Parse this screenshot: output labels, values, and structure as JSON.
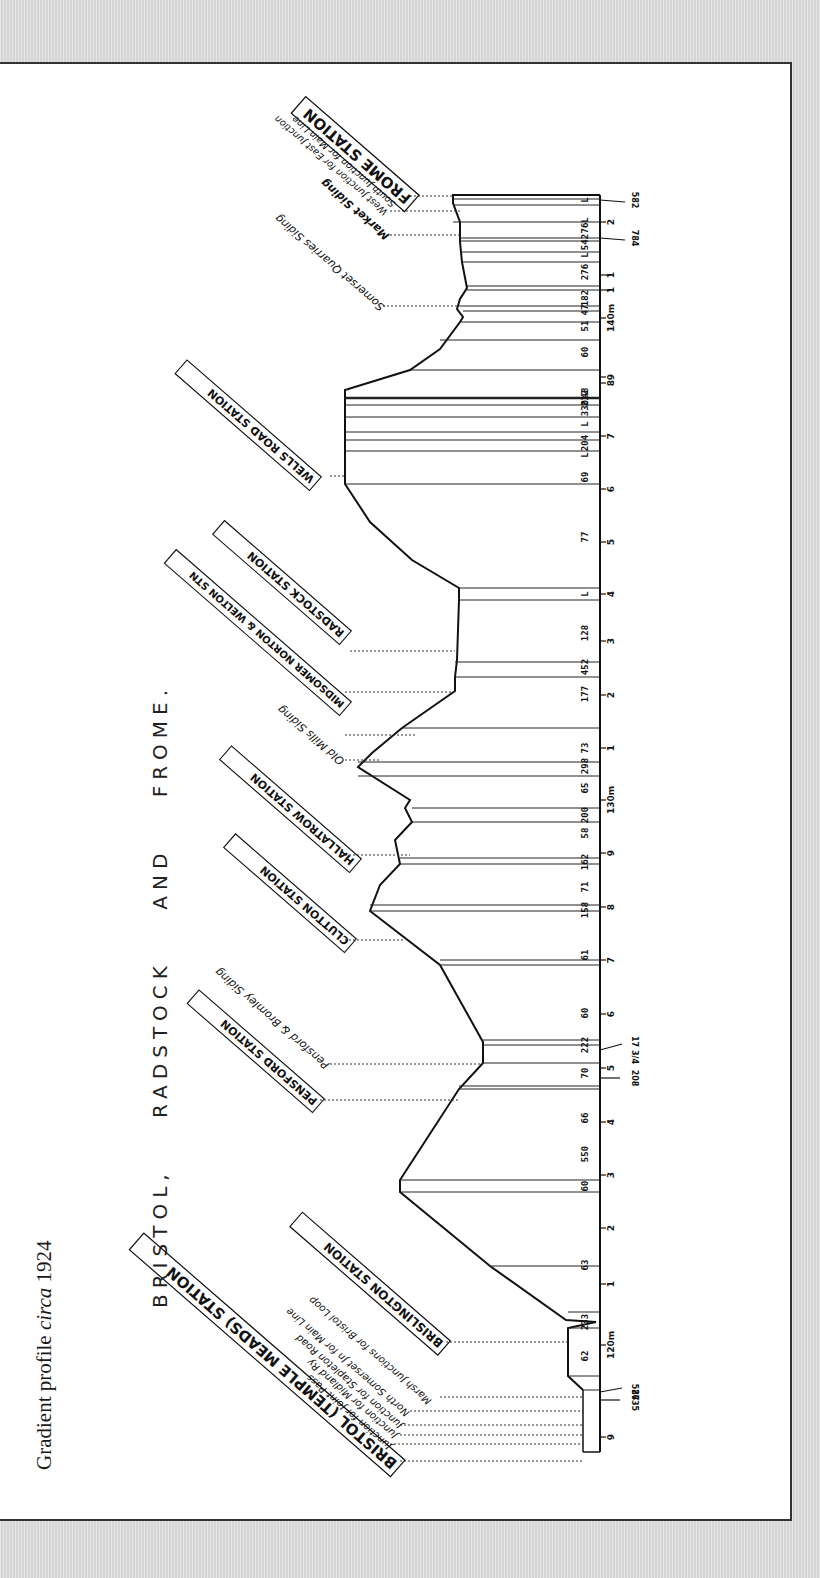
{
  "caption": {
    "prefix": "Gradient profile ",
    "italic": "circa",
    "suffix": " 1924"
  },
  "title": "BRISTOL, RADSTOCK AND FROME.",
  "stations": [
    {
      "label": "BRISTOL (TEMPLE MEADS) STATION",
      "boxed": true
    },
    {
      "label": "BRISLINGTON STATION",
      "boxed": true
    },
    {
      "label": "PENSFORD STATION",
      "boxed": true
    },
    {
      "label": "CLUTTON STATION",
      "boxed": true
    },
    {
      "label": "HALLATROW STATION",
      "boxed": true
    },
    {
      "label": "MIDSOMER NORTON & WELTON STN",
      "boxed": true
    },
    {
      "label": "RADSTOCK STATION",
      "boxed": true
    },
    {
      "label": "WELLS ROAD STATION",
      "boxed": true
    },
    {
      "label": "FROME STATION",
      "boxed": true
    }
  ],
  "junctions_bristol": [
    "Junction for Joint Pass",
    "Junction for Midland Ry",
    "Junction for Stapleton Road",
    "North Somerset Jn for Main Line",
    "Marsh Junctions for Bristol Loop"
  ],
  "sidings": [
    "Pensford & Bromley Siding",
    "Old Mills Siding",
    "Somerset Quarries Siding",
    "Market Siding",
    "West Junction for East Junction",
    "South Junction for Main Line"
  ],
  "chart_data": {
    "type": "line",
    "title": "BRISTOL, RADSTOCK AND FROME.",
    "caption": "Gradient profile circa 1924",
    "orientation": "rotated 90° (distance runs bottom→top, Bristol at bottom, Frome at top)",
    "gradients_bristol_to_frome": [
      "L",
      "62",
      "233",
      "63",
      "60",
      "550",
      "66",
      "70",
      "222",
      "60",
      "58",
      "61",
      "158",
      "71",
      "162",
      "58",
      "200",
      "65",
      "298",
      "73",
      "177",
      "452",
      "128",
      "L",
      "77",
      "69",
      "L",
      "204",
      "L",
      "330",
      "212",
      "48",
      "60",
      "51",
      "47",
      "182",
      "276",
      "L",
      "542",
      "76",
      "L",
      "L"
    ],
    "mileposts": [
      "9",
      "120m",
      "1",
      "2",
      "3",
      "4",
      "5",
      "6",
      "7",
      "8",
      "9",
      "130m",
      "1",
      "2",
      "3",
      "4",
      "5",
      "6",
      "7",
      "8",
      "9",
      "140m",
      "1",
      "1",
      "2"
    ],
    "chainage_marks": [
      "587",
      "2635",
      "208",
      "17 3/4",
      "784",
      "582"
    ]
  },
  "gradient_labels": [
    {
      "t": "62",
      "y": 1356
    },
    {
      "t": "233",
      "y": 1322
    },
    {
      "t": "63",
      "y": 1265
    },
    {
      "t": "60",
      "y": 1186
    },
    {
      "t": "550",
      "y": 1154
    },
    {
      "t": "66",
      "y": 1118
    },
    {
      "t": "70",
      "y": 1073
    },
    {
      "t": "222",
      "y": 1045
    },
    {
      "t": "60",
      "y": 1013
    },
    {
      "t": "61",
      "y": 955
    },
    {
      "t": "158",
      "y": 910
    },
    {
      "t": "71",
      "y": 887
    },
    {
      "t": "162",
      "y": 862
    },
    {
      "t": "58",
      "y": 833
    },
    {
      "t": "200",
      "y": 815
    },
    {
      "t": "65",
      "y": 788
    },
    {
      "t": "298",
      "y": 766
    },
    {
      "t": "73",
      "y": 748
    },
    {
      "t": "177",
      "y": 694
    },
    {
      "t": "452",
      "y": 667
    },
    {
      "t": "128",
      "y": 633
    },
    {
      "t": "L",
      "y": 594
    },
    {
      "t": "77",
      "y": 537
    },
    {
      "t": "69",
      "y": 477
    },
    {
      "t": "L",
      "y": 455
    },
    {
      "t": "204",
      "y": 443
    },
    {
      "t": "L",
      "y": 424
    },
    {
      "t": "330",
      "y": 408
    },
    {
      "t": "212",
      "y": 398
    },
    {
      "t": "48",
      "y": 393
    },
    {
      "t": "60",
      "y": 352
    },
    {
      "t": "51",
      "y": 326
    },
    {
      "t": "47",
      "y": 310
    },
    {
      "t": "182",
      "y": 298
    },
    {
      "t": "276",
      "y": 272
    },
    {
      "t": "L",
      "y": 255
    },
    {
      "t": "542",
      "y": 242
    },
    {
      "t": "76",
      "y": 228
    },
    {
      "t": "L",
      "y": 220
    },
    {
      "t": "L",
      "y": 200
    }
  ],
  "milepost_labels": [
    {
      "t": "9",
      "y": 1437
    },
    {
      "t": "120m",
      "y": 1345
    },
    {
      "t": "1",
      "y": 1284
    },
    {
      "t": "2",
      "y": 1228
    },
    {
      "t": "3",
      "y": 1175
    },
    {
      "t": "4",
      "y": 1122
    },
    {
      "t": "5",
      "y": 1068
    },
    {
      "t": "6",
      "y": 1014
    },
    {
      "t": "7",
      "y": 960
    },
    {
      "t": "8",
      "y": 907
    },
    {
      "t": "9",
      "y": 853
    },
    {
      "t": "130m",
      "y": 800
    },
    {
      "t": "1",
      "y": 748
    },
    {
      "t": "2",
      "y": 695
    },
    {
      "t": "3",
      "y": 641
    },
    {
      "t": "4",
      "y": 594
    },
    {
      "t": "5",
      "y": 542
    },
    {
      "t": "6",
      "y": 489
    },
    {
      "t": "7",
      "y": 436
    },
    {
      "t": "8",
      "y": 383
    },
    {
      "t": "9",
      "y": 377
    },
    {
      "t": "140m",
      "y": 318
    },
    {
      "t": "1",
      "y": 290
    },
    {
      "t": "1",
      "y": 275
    },
    {
      "t": "2",
      "y": 222
    }
  ],
  "chainage_labels": [
    {
      "t": "587",
      "y": 1392
    },
    {
      "t": "2635",
      "y": 1400
    },
    {
      "t": "208",
      "y": 1078
    },
    {
      "t": "17 3/4",
      "y": 1050
    },
    {
      "t": "784",
      "y": 238
    },
    {
      "t": "582",
      "y": 200
    }
  ]
}
